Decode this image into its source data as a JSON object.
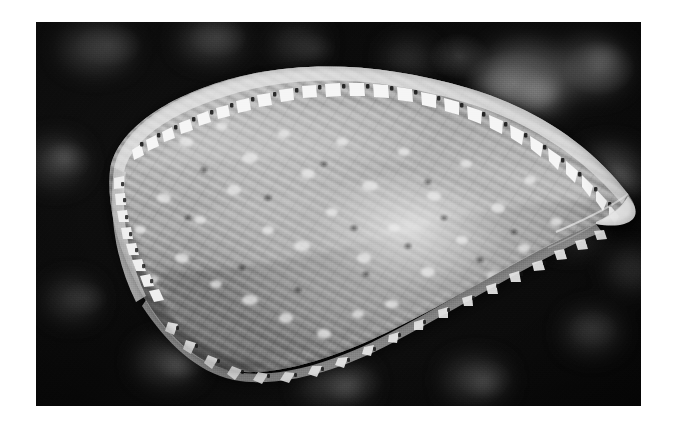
{
  "page": {
    "background_color": "#ffffff",
    "width": 678,
    "height": 428
  },
  "photograph": {
    "alt_text": "Black and white photograph of a ribbed bivalve mollusc shell resting on dark mottled substrate",
    "subject": "ribbed bivalve shell specimen",
    "orientation": "elongate, tapering from rounded left end to pointed right tip",
    "color_mode": "grayscale",
    "frame": {
      "left": 36,
      "top": 22,
      "width": 605,
      "height": 384,
      "border_color": "#000000"
    },
    "background": {
      "description": "dark mottled rocky substrate with faint pale blobs",
      "base_color": "#0c0c0c",
      "highlight_color": "#9a9a9a"
    },
    "specimen": {
      "body_color": "#8e8e8e",
      "highlight_color": "#e8e8e8",
      "shadow_color": "#2a2a2a",
      "margin_teeth_color": "#f2f2f2",
      "rib_count": 26,
      "features": [
        "fine longitudinal ribs radiating along the length",
        "beaded white serrated margin along the dorsal edge",
        "scalloped crenulate ventral margin",
        "mottled pale speckling across the valve surface",
        "bright specular highlight near the centre-right of the valve",
        "rounded anterior end at left, acutely pointed posterior tip at right"
      ]
    }
  }
}
